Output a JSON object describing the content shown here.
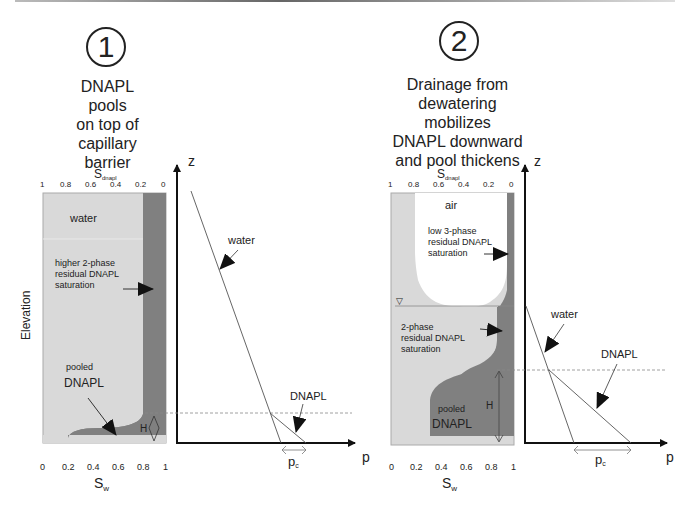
{
  "panels": [
    {
      "number": "1",
      "title_lines": [
        "DNAPL",
        "pools",
        "on top of",
        "capillary",
        "barrier"
      ],
      "column": {
        "top_axis_label": "S",
        "top_axis_sub": "dnapl",
        "top_ticks": [
          "1",
          "0.8",
          "0.6",
          "0.4",
          "0.2",
          "0"
        ],
        "bottom_ticks": [
          "0",
          "0.2",
          "0.4",
          "0.6",
          "0.8",
          "1"
        ],
        "bottom_axis_label": "S",
        "bottom_axis_sub": "w",
        "side_label": "Elevation",
        "labels": {
          "water": "water",
          "residual": [
            "higher 2-phase",
            "residual DNAPL",
            "saturation"
          ],
          "pooled_small": "pooled",
          "pooled_big": "DNAPL",
          "height": "H"
        }
      },
      "chart": {
        "z_label": "z",
        "p_label": "p",
        "water_label": "water",
        "dnapl_label": "DNAPL",
        "pc_label": "p",
        "pc_sub": "c"
      }
    },
    {
      "number": "2",
      "title_lines": [
        "Drainage from",
        "dewatering",
        "mobilizes",
        "DNAPL downward",
        "and pool thickens"
      ],
      "column": {
        "top_axis_label": "S",
        "top_axis_sub": "dnapl",
        "top_ticks": [
          "1",
          "0.8",
          "0.6",
          "0.4",
          "0.2",
          "0"
        ],
        "bottom_ticks": [
          "0",
          "0.2",
          "0.4",
          "0.6",
          "0.8",
          "1"
        ],
        "bottom_axis_label": "S",
        "bottom_axis_sub": "w",
        "labels": {
          "air": "air",
          "residual3": [
            "low 3-phase",
            "residual DNAPL",
            "saturation"
          ],
          "residual2": [
            "2-phase",
            "residual DNAPL",
            "saturation"
          ],
          "pooled_small": "pooled",
          "pooled_big": "DNAPL",
          "height": "H",
          "water_table": "▽"
        }
      },
      "chart": {
        "z_label": "z",
        "p_label": "p",
        "water_label": "water",
        "dnapl_label": "DNAPL",
        "pc_label": "p",
        "pc_sub": "c"
      }
    }
  ],
  "colors": {
    "water_fill": "#d9d9d9",
    "dnapl_fill": "#808080",
    "air_fill": "#ffffff",
    "line": "#333333"
  }
}
